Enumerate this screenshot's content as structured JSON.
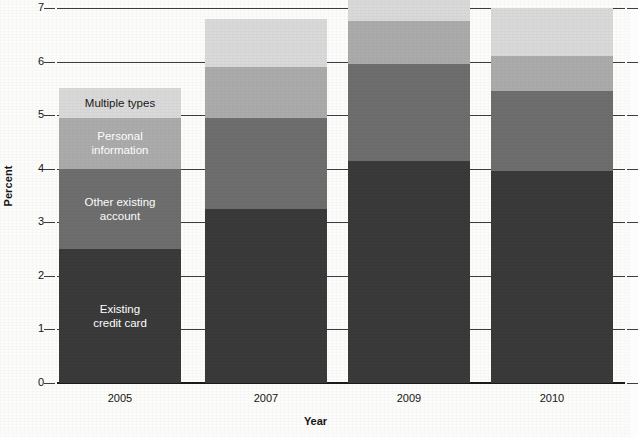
{
  "chart_data": {
    "type": "bar",
    "subtype": "stacked-bar",
    "title": "",
    "xlabel": "Year",
    "ylabel": "Percent",
    "categories": [
      "2005",
      "2007",
      "2009",
      "2010"
    ],
    "ylim": [
      0,
      7
    ],
    "y_ticks": [
      0,
      1,
      2,
      3,
      4,
      5,
      6,
      7
    ],
    "y_tick_labels": [
      "0",
      "1",
      "2",
      "3",
      "4",
      "5",
      "6",
      "7"
    ],
    "grid": true,
    "legend": "in-bar labels on first bar (2005)",
    "series": [
      {
        "name": "Existing credit card",
        "color": "#3a3a3a",
        "label_color": "#ffffff",
        "values": [
          2.5,
          3.25,
          4.15,
          3.95
        ]
      },
      {
        "name": "Other existing account",
        "color": "#6e6e6e",
        "label_color": "#ffffff",
        "values": [
          1.5,
          1.7,
          1.8,
          1.5
        ]
      },
      {
        "name": "Personal information",
        "color": "#ababab",
        "label_color": "#ffffff",
        "values": [
          0.95,
          0.95,
          0.8,
          0.65
        ]
      },
      {
        "name": "Multiple types",
        "color": "#d9d9d9",
        "label_color": "#1a1a1a",
        "values": [
          0.55,
          0.9,
          0.5,
          0.9
        ]
      }
    ],
    "totals": [
      5.5,
      6.8,
      7.25,
      7.0
    ],
    "segment_labels": [
      "Existing\ncredit card",
      "Other existing\naccount",
      "Personal\ninformation",
      "Multiple types"
    ]
  },
  "axis": {
    "y_title": "Percent",
    "x_title": "Year"
  }
}
